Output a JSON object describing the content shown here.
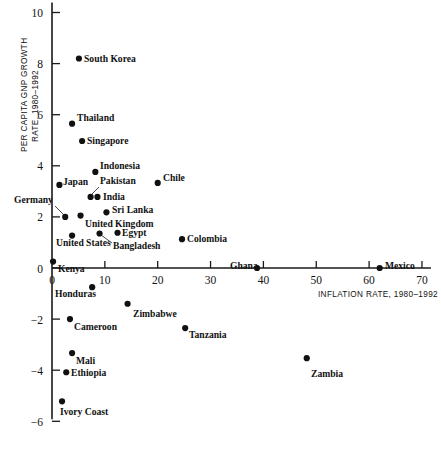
{
  "chart_data": {
    "type": "scatter",
    "title": "",
    "xlabel": "INFLATION RATE, 1980–1992",
    "ylabel_line1": "PER CAPITA GNP GROWTH",
    "ylabel_line2": "RATE, 1980–1992",
    "xlim": [
      0,
      70
    ],
    "ylim": [
      -6,
      10
    ],
    "xticks": [
      "0",
      "10",
      "20",
      "30",
      "40",
      "50",
      "60",
      "70"
    ],
    "xtick_values": [
      0,
      10,
      20,
      30,
      40,
      50,
      60,
      70
    ],
    "yticks": [
      "10",
      "8",
      "6",
      "4",
      "2",
      "0",
      "−2",
      "−4",
      "−6"
    ],
    "ytick_values": [
      10,
      8,
      6,
      4,
      2,
      0,
      -2,
      -4,
      -6
    ],
    "grid": false,
    "legend": "none",
    "marker_color": "#111111",
    "axis_color": "#1a1a1a",
    "points": [
      {
        "label": "South Korea",
        "x": 5.1,
        "y": 8.2,
        "lx": 84,
        "ly": 62,
        "anchor": "start",
        "leader": null
      },
      {
        "label": "Thailand",
        "x": 3.8,
        "y": 5.65,
        "lx": 77,
        "ly": 121,
        "anchor": "start",
        "leader": null
      },
      {
        "label": "Singapore",
        "x": 5.7,
        "y": 4.97,
        "lx": 87,
        "ly": 144,
        "anchor": "start",
        "leader": null
      },
      {
        "label": "Indonesia",
        "x": 8.2,
        "y": 3.76,
        "lx": 100,
        "ly": 169,
        "anchor": "start",
        "leader": null
      },
      {
        "label": "Chile",
        "x": 20.0,
        "y": 3.33,
        "lx": 163,
        "ly": 181,
        "anchor": "start",
        "leader": null
      },
      {
        "label": "Japan",
        "x": 1.4,
        "y": 3.25,
        "lx": 63,
        "ly": 185,
        "anchor": "start",
        "leader": null
      },
      {
        "label": "Pakistan",
        "x": 7.3,
        "y": 2.78,
        "lx": 100,
        "ly": 184,
        "anchor": "start",
        "leader": [
          99,
          187,
          91,
          195
        ]
      },
      {
        "label": "India",
        "x": 8.6,
        "y": 2.78,
        "lx": 103,
        "ly": 200,
        "anchor": "start",
        "leader": null
      },
      {
        "label": "Sri Lanka",
        "x": 10.3,
        "y": 2.18,
        "lx": 112,
        "ly": 213,
        "anchor": "start",
        "leader": null
      },
      {
        "label": "Germany",
        "x": 2.5,
        "y": 2.0,
        "lx": 14,
        "ly": 203,
        "anchor": "start",
        "leader": [
          55,
          206,
          64,
          215
        ]
      },
      {
        "label": "United Kingdom",
        "x": 5.4,
        "y": 2.05,
        "lx": 85,
        "ly": 227,
        "anchor": "start",
        "leader": null
      },
      {
        "label": "United States",
        "x": 3.8,
        "y": 1.27,
        "lx": 56,
        "ly": 246,
        "anchor": "start",
        "leader": null
      },
      {
        "label": "Bangladesh",
        "x": 9.0,
        "y": 1.35,
        "lx": 113,
        "ly": 249,
        "anchor": "start",
        "leader": [
          112,
          243,
          101,
          235
        ]
      },
      {
        "label": "Egypt",
        "x": 12.4,
        "y": 1.38,
        "lx": 122,
        "ly": 236,
        "anchor": "start",
        "leader": null
      },
      {
        "label": "Colombia",
        "x": 24.6,
        "y": 1.13,
        "lx": 187,
        "ly": 242,
        "anchor": "start",
        "leader": null
      },
      {
        "label": "Kenya",
        "x": 0.2,
        "y": 0.25,
        "lx": 58,
        "ly": 272,
        "anchor": "start",
        "leader": null
      },
      {
        "label": "Ghana",
        "x": 38.8,
        "y": 0.0,
        "lx": 230,
        "ly": 269,
        "anchor": "start",
        "leader": null
      },
      {
        "label": "Mexico",
        "x": 62.0,
        "y": 0.0,
        "lx": 385,
        "ly": 269,
        "anchor": "start",
        "leader": null
      },
      {
        "label": "Honduras",
        "x": 7.6,
        "y": -0.75,
        "lx": 55,
        "ly": 297,
        "anchor": "start",
        "leader": null
      },
      {
        "label": "Zimbabwe",
        "x": 14.3,
        "y": -1.4,
        "lx": 133,
        "ly": 317,
        "anchor": "start",
        "leader": null
      },
      {
        "label": "Cameroon",
        "x": 3.4,
        "y": -2.0,
        "lx": 74,
        "ly": 330,
        "anchor": "start",
        "leader": null
      },
      {
        "label": "Tanzania",
        "x": 25.2,
        "y": -2.35,
        "lx": 189,
        "ly": 338,
        "anchor": "start",
        "leader": null
      },
      {
        "label": "Mali",
        "x": 3.8,
        "y": -3.33,
        "lx": 76,
        "ly": 364,
        "anchor": "start",
        "leader": null
      },
      {
        "label": "Ethiopia",
        "x": 2.7,
        "y": -4.08,
        "lx": 71,
        "ly": 376,
        "anchor": "start",
        "leader": null
      },
      {
        "label": "Zambia",
        "x": 48.2,
        "y": -3.53,
        "lx": 311,
        "ly": 377,
        "anchor": "start",
        "leader": null
      },
      {
        "label": "Ivory Coast",
        "x": 1.9,
        "y": -5.22,
        "lx": 60,
        "ly": 415,
        "anchor": "start",
        "leader": null
      }
    ]
  }
}
